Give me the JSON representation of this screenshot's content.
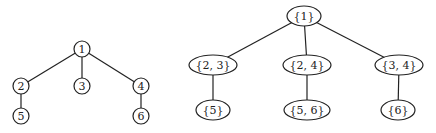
{
  "left_tree": {
    "nodes": [
      {
        "id": "1",
        "label": "1",
        "x": 82,
        "y": 49
      },
      {
        "id": "2",
        "label": "2",
        "x": 21,
        "y": 86
      },
      {
        "id": "3",
        "label": "3",
        "x": 82,
        "y": 86
      },
      {
        "id": "4",
        "label": "4",
        "x": 141,
        "y": 86
      },
      {
        "id": "5",
        "label": "5",
        "x": 21,
        "y": 116
      },
      {
        "id": "6",
        "label": "6",
        "x": 141,
        "y": 116
      }
    ],
    "edges": [
      [
        "1",
        "2"
      ],
      [
        "1",
        "3"
      ],
      [
        "1",
        "4"
      ],
      [
        "2",
        "5"
      ],
      [
        "4",
        "6"
      ]
    ]
  },
  "right_tree": {
    "nodes": [
      {
        "id": "a",
        "label": "{1}",
        "x": 304,
        "y": 16,
        "rx": 17
      },
      {
        "id": "b",
        "label": "{2, 3}",
        "x": 213,
        "y": 65,
        "rx": 24
      },
      {
        "id": "c",
        "label": "{2, 4}",
        "x": 307,
        "y": 65,
        "rx": 24
      },
      {
        "id": "d",
        "label": "{3, 4}",
        "x": 399,
        "y": 65,
        "rx": 24
      },
      {
        "id": "e",
        "label": "{5}",
        "x": 213,
        "y": 110,
        "rx": 17
      },
      {
        "id": "f",
        "label": "{5, 6}",
        "x": 307,
        "y": 110,
        "rx": 23
      },
      {
        "id": "g",
        "label": "{6}",
        "x": 398,
        "y": 110,
        "rx": 17
      }
    ],
    "edges": [
      [
        "a",
        "b"
      ],
      [
        "a",
        "c"
      ],
      [
        "a",
        "d"
      ],
      [
        "b",
        "e"
      ],
      [
        "c",
        "f"
      ],
      [
        "d",
        "g"
      ]
    ]
  }
}
